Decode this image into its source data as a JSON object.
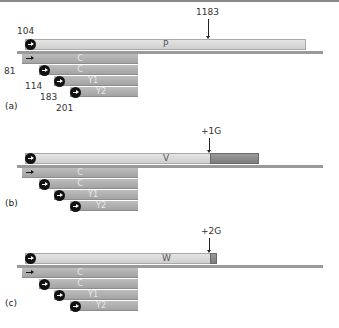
{
  "panels": [
    {
      "letter": "(a)",
      "main_label": "P",
      "marker_label": "1183",
      "start_label": "104",
      "sub_numbers": [
        "81",
        "114",
        "183",
        "201"
      ],
      "sub_labels": [
        "C",
        "C",
        "Y1",
        "Y2"
      ],
      "extension": "none"
    },
    {
      "letter": "(b)",
      "main_label": "V",
      "marker_label": "+1G",
      "sub_labels": [
        "C",
        "C",
        "Y1",
        "Y2"
      ],
      "extension": "long",
      "extension_color": "#8a8a8a"
    },
    {
      "letter": "(c)",
      "main_label": "W",
      "marker_label": "+2G",
      "sub_labels": [
        "C",
        "C",
        "Y1",
        "Y2"
      ],
      "extension": "short",
      "extension_color": "#8a8a8a"
    }
  ]
}
